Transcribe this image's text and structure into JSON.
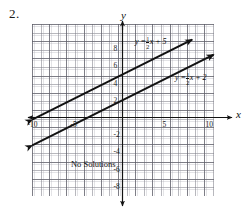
{
  "problem": {
    "number": "2."
  },
  "chart_data": {
    "type": "line",
    "title": "",
    "xlabel": "x",
    "ylabel": "y",
    "xlim": [
      -10.5,
      10.5
    ],
    "ylim": [
      -9.5,
      9.5
    ],
    "grid": true,
    "grid_step": 1,
    "major_grid_step": 2,
    "x_ticks": [
      -10,
      -5,
      5,
      10
    ],
    "y_ticks": [
      8,
      6,
      4,
      2,
      -2,
      -4,
      -6,
      -8
    ],
    "x_tick_labels": [
      "-10",
      "-5",
      "5",
      "10"
    ],
    "y_tick_labels": [
      "8",
      "6",
      "4",
      "2",
      "-2",
      "-4",
      "-6",
      "-8"
    ],
    "annotations": [
      {
        "text": "No Solutions",
        "x": -6.0,
        "y": -5.4
      }
    ],
    "series": [
      {
        "name": "y = 1/2 x + 5",
        "slope": 0.5,
        "intercept": 5,
        "color": "#111111",
        "label_parts": {
          "lhs": "y = ",
          "num": "1",
          "den": "2",
          "rhs": "x + 5"
        },
        "arrows": "both",
        "points": [
          [
            -10.5,
            -0.25
          ],
          [
            8.1,
            9.05
          ]
        ]
      },
      {
        "name": "y = 1/2 x + 2",
        "slope": 0.5,
        "intercept": 2,
        "color": "#111111",
        "label_parts": {
          "lhs": "y = ",
          "num": "1",
          "den": "2",
          "rhs": "x + 2"
        },
        "arrows": "both",
        "points": [
          [
            -10.5,
            -3.25
          ],
          [
            10.6,
            7.3
          ]
        ]
      }
    ]
  },
  "axes": {
    "x_name": "x",
    "y_name": "y"
  }
}
